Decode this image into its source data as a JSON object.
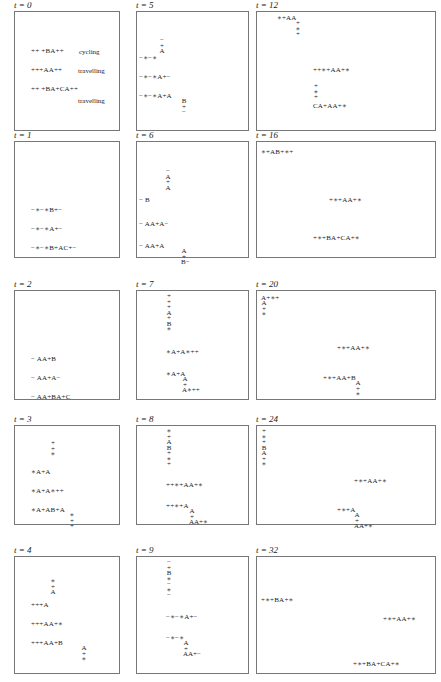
{
  "figure": {
    "panels": [
      {
        "id": "t0",
        "label": "t = 0",
        "box": [
          14,
          11,
          106,
          120
        ],
        "rows": [
          {
            "text": "++ +BA++",
            "x": 16,
            "y": 36
          },
          {
            "text": "+++AA++",
            "x": 16,
            "y": 55
          },
          {
            "text": "++ +BA+CA++",
            "x": 16,
            "y": 74
          }
        ],
        "notes": [
          {
            "text": "cycling",
            "x": 64,
            "y": 36
          },
          {
            "text": "travelling",
            "x": 63,
            "y": 55
          },
          {
            "text": "travelling",
            "x": 63,
            "y": 85
          }
        ],
        "stacks": []
      },
      {
        "id": "t1",
        "label": "t = 1",
        "box": [
          14,
          141,
          106,
          117
        ],
        "rows": [
          {
            "text": "−∗−∗B+−",
            "x": 16,
            "y": 65
          },
          {
            "text": "−∗−∗A+−",
            "x": 16,
            "y": 84
          },
          {
            "text": "−∗−∗B+AC+−",
            "x": 16,
            "y": 103
          }
        ],
        "notes": [],
        "stacks": []
      },
      {
        "id": "t2",
        "label": "t = 2",
        "box": [
          14,
          290,
          106,
          110
        ],
        "rows": [
          {
            "text": "−  AA+B",
            "x": 16,
            "y": 65
          },
          {
            "text": "−  AA+A−",
            "x": 16,
            "y": 84
          },
          {
            "text": "−  AA+BA+C",
            "x": 16,
            "y": 103
          }
        ],
        "notes": [],
        "stacks": []
      },
      {
        "id": "t3",
        "label": "t = 3",
        "box": [
          14,
          425,
          106,
          100
        ],
        "rows": [
          {
            "text": "∗A+A",
            "x": 16,
            "y": 43
          },
          {
            "text": "∗A+A∗++",
            "x": 16,
            "y": 62
          },
          {
            "text": "∗A+AB+A",
            "x": 16,
            "y": 81
          }
        ],
        "notes": [],
        "stacks": [
          {
            "chars": [
              "+",
              "+",
              "∗"
            ],
            "x": 35,
            "y": 15
          },
          {
            "chars": [
              "∗",
              "+",
              "+"
            ],
            "x": 54,
            "y": 87
          }
        ]
      },
      {
        "id": "t4",
        "label": "t = 4",
        "box": [
          14,
          556,
          106,
          118
        ],
        "rows": [
          {
            "text": "+++A",
            "x": 16,
            "y": 45
          },
          {
            "text": "+++AA+∗",
            "x": 16,
            "y": 64
          },
          {
            "text": "+++AA+B",
            "x": 16,
            "y": 83
          }
        ],
        "notes": [],
        "stacks": [
          {
            "chars": [
              "∗",
              "+",
              "A"
            ],
            "x": 35,
            "y": 22
          },
          {
            "chars": [
              "A",
              "+",
              "∗"
            ],
            "x": 66,
            "y": 89
          }
        ]
      },
      {
        "id": "t5",
        "label": "t = 5",
        "box": [
          136,
          11,
          113,
          120
        ],
        "rows": [
          {
            "text": "−∗−∗",
            "x": 2,
            "y": 43
          },
          {
            "text": "−∗−∗A+−",
            "x": 2,
            "y": 62
          },
          {
            "text": "−∗−∗A+A",
            "x": 2,
            "y": 81
          }
        ],
        "notes": [],
        "stacks": [
          {
            "chars": [
              "−",
              "+",
              "A"
            ],
            "x": 22,
            "y": 26
          },
          {
            "chars": [
              "B",
              "+",
              "−"
            ],
            "x": 44,
            "y": 87
          }
        ]
      },
      {
        "id": "t6",
        "label": "t = 6",
        "box": [
          136,
          141,
          113,
          117
        ],
        "rows": [
          {
            "text": "−   B",
            "x": 2,
            "y": 55
          },
          {
            "text": "−   AA+A−",
            "x": 2,
            "y": 79
          },
          {
            "text": "−   AA+A",
            "x": 2,
            "y": 101
          }
        ],
        "notes": [],
        "stacks": [
          {
            "chars": [
              "−",
              "A",
              "+",
              "A"
            ],
            "x": 28,
            "y": 27
          },
          {
            "chars": [
              "A",
              "+",
              "B−"
            ],
            "x": 44,
            "y": 107
          }
        ]
      },
      {
        "id": "t7",
        "label": "t = 7",
        "box": [
          136,
          290,
          113,
          110
        ],
        "rows": [
          {
            "text": "∗A+A∗++",
            "x": 29,
            "y": 58
          },
          {
            "text": "∗A+A",
            "x": 29,
            "y": 80
          }
        ],
        "notes": [],
        "stacks": [
          {
            "chars": [
              "+",
              "+",
              "+",
              "A",
              "+",
              "B",
              "∗"
            ],
            "x": 29,
            "y": 3
          },
          {
            "chars": [
              "A",
              "+",
              "A∗++"
            ],
            "x": 45,
            "y": 86
          }
        ]
      },
      {
        "id": "t8",
        "label": "t = 8",
        "box": [
          136,
          425,
          113,
          100
        ],
        "rows": [
          {
            "text": "++∗+AA+∗",
            "x": 29,
            "y": 56
          },
          {
            "text": "++∗+A",
            "x": 29,
            "y": 77
          }
        ],
        "notes": [],
        "stacks": [
          {
            "chars": [
              "∗",
              "+",
              "A",
              "B",
              "+",
              "∗",
              "+"
            ],
            "x": 29,
            "y": 3
          },
          {
            "chars": [
              "A",
              "+",
              "AA+∗"
            ],
            "x": 52,
            "y": 83
          }
        ]
      },
      {
        "id": "t9",
        "label": "t = 9",
        "box": [
          136,
          556,
          113,
          118
        ],
        "rows": [
          {
            "text": "−∗−∗A+−",
            "x": 29,
            "y": 57
          },
          {
            "text": "−∗−∗",
            "x": 29,
            "y": 78
          }
        ],
        "notes": [],
        "stacks": [
          {
            "chars": [
              "−",
              "+",
              "B",
              "∗",
              "−",
              "∗",
              "−"
            ],
            "x": 29,
            "y": 3
          },
          {
            "chars": [
              "A",
              "+",
              "AA+−"
            ],
            "x": 46,
            "y": 84
          }
        ]
      },
      {
        "id": "t12",
        "label": "t = 12",
        "box": [
          256,
          11,
          180,
          120
        ],
        "rows": [
          {
            "text": "∗+AA",
            "x": 20,
            "y": 3
          },
          {
            "text": "++∗+AA+∗",
            "x": 56,
            "y": 55
          },
          {
            "text": "CA+AA+∗",
            "x": 56,
            "y": 91
          }
        ],
        "notes": [],
        "stacks": [
          {
            "chars": [
              "+",
              "∗",
              "+"
            ],
            "x": 38,
            "y": 9
          },
          {
            "chars": [
              "+",
              "∗",
              "+"
            ],
            "x": 56,
            "y": 72
          }
        ]
      },
      {
        "id": "t16",
        "label": "t = 16",
        "box": [
          256,
          141,
          180,
          117
        ],
        "rows": [
          {
            "text": "∗+AB+∗+",
            "x": 4,
            "y": 7
          },
          {
            "text": "+∗+AA+∗",
            "x": 72,
            "y": 55
          },
          {
            "text": "+∗+BA+CA+∗",
            "x": 56,
            "y": 93
          }
        ],
        "notes": [],
        "stacks": []
      },
      {
        "id": "t20",
        "label": "t = 20",
        "box": [
          256,
          290,
          180,
          110
        ],
        "rows": [
          {
            "text": "A+∗+",
            "x": 4,
            "y": 4
          },
          {
            "text": "+∗+AA+∗",
            "x": 80,
            "y": 54
          },
          {
            "text": "+∗+AA+B",
            "x": 66,
            "y": 84
          }
        ],
        "notes": [],
        "stacks": [
          {
            "chars": [
              "A",
              "+",
              "∗"
            ],
            "x": 4,
            "y": 10
          },
          {
            "chars": [
              "A",
              "+",
              "∗"
            ],
            "x": 98,
            "y": 90
          }
        ]
      },
      {
        "id": "t24",
        "label": "t = 24",
        "box": [
          256,
          425,
          180,
          100
        ],
        "rows": [
          {
            "text": "+∗+AA+∗",
            "x": 97,
            "y": 52
          },
          {
            "text": "+∗+A",
            "x": 80,
            "y": 81
          }
        ],
        "notes": [],
        "stacks": [
          {
            "chars": [
              "+",
              "∗",
              "+",
              "B",
              "A",
              "+",
              "∗"
            ],
            "x": 4,
            "y": 3
          },
          {
            "chars": [
              "A",
              "+",
              "AA+∗"
            ],
            "x": 97,
            "y": 87
          }
        ]
      },
      {
        "id": "t32",
        "label": "t = 32",
        "box": [
          256,
          556,
          180,
          118
        ],
        "rows": [
          {
            "text": "+∗+BA+∗",
            "x": 4,
            "y": 40
          },
          {
            "text": "+∗+AA+∗",
            "x": 126,
            "y": 59
          },
          {
            "text": "+∗+BA+CA+∗",
            "x": 96,
            "y": 104
          }
        ],
        "notes": [],
        "stacks": []
      }
    ]
  }
}
